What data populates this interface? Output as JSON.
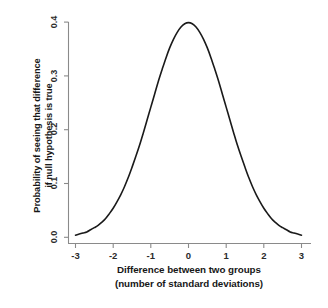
{
  "chart_data": {
    "type": "line",
    "title": "",
    "subtitle": "",
    "xlabel_line1": "Difference between two groups",
    "xlabel_line2": "(number of standard deviations)",
    "ylabel_line1": "Probability of seeing that difference",
    "ylabel_line2": "if null hypothesis is true",
    "xlim": [
      -3,
      3
    ],
    "ylim": [
      0.0,
      0.4
    ],
    "xticks": [
      "-3",
      "-2",
      "-1",
      "0",
      "1",
      "2",
      "3"
    ],
    "xtick_values": [
      -3,
      -2,
      -1,
      0,
      1,
      2,
      3
    ],
    "yticks": [
      "0.0",
      "0.1",
      "0.2",
      "0.3",
      "0.4"
    ],
    "ytick_values": [
      0.0,
      0.1,
      0.2,
      0.3,
      0.4
    ],
    "grid": false,
    "legend": false,
    "legend_position": "none",
    "distribution": "standard normal (Gaussian), mean 0, standard deviation 1",
    "series": [
      {
        "name": "Standard normal probability density",
        "color": "#1a1a1a",
        "x": [
          -3.0,
          -2.9,
          -2.8,
          -2.7,
          -2.6,
          -2.5,
          -2.4,
          -2.3,
          -2.2,
          -2.1,
          -2.0,
          -1.9,
          -1.8,
          -1.7,
          -1.6,
          -1.5,
          -1.4,
          -1.3,
          -1.2,
          -1.1,
          -1.0,
          -0.9,
          -0.8,
          -0.7,
          -0.6,
          -0.5,
          -0.4,
          -0.3,
          -0.2,
          -0.1,
          0.0,
          0.1,
          0.2,
          0.3,
          0.4,
          0.5,
          0.6,
          0.7,
          0.8,
          0.9,
          1.0,
          1.1,
          1.2,
          1.3,
          1.4,
          1.5,
          1.6,
          1.7,
          1.8,
          1.9,
          2.0,
          2.1,
          2.2,
          2.3,
          2.4,
          2.5,
          2.6,
          2.7,
          2.8,
          2.9,
          3.0
        ],
        "y": [
          0.004,
          0.006,
          0.008,
          0.01,
          0.014,
          0.018,
          0.022,
          0.028,
          0.035,
          0.044,
          0.054,
          0.066,
          0.079,
          0.094,
          0.111,
          0.13,
          0.15,
          0.171,
          0.194,
          0.218,
          0.242,
          0.266,
          0.29,
          0.312,
          0.333,
          0.352,
          0.368,
          0.381,
          0.391,
          0.397,
          0.399,
          0.397,
          0.391,
          0.381,
          0.368,
          0.352,
          0.333,
          0.312,
          0.29,
          0.266,
          0.242,
          0.218,
          0.194,
          0.171,
          0.15,
          0.13,
          0.111,
          0.094,
          0.079,
          0.066,
          0.054,
          0.044,
          0.035,
          0.028,
          0.022,
          0.018,
          0.014,
          0.01,
          0.008,
          0.006,
          0.004
        ]
      }
    ],
    "peak": {
      "x": 0,
      "y": 0.4
    },
    "colors": {
      "curve": "#1a1a1a",
      "axis": "#8a8a8a",
      "tick_label": "#2b2b2b",
      "axis_title": "#171717",
      "background": "#ffffff"
    }
  }
}
